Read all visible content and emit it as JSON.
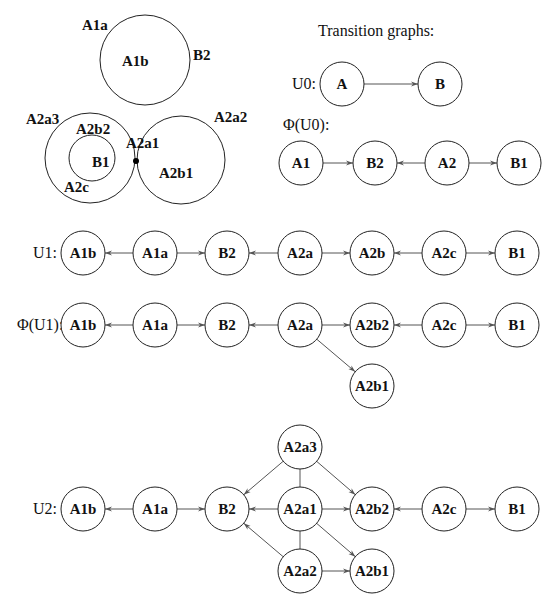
{
  "venn": {
    "circles": [
      {
        "id": "A1",
        "cx": 145,
        "cy": 60,
        "r": 45
      },
      {
        "id": "A2a3_outer",
        "cx": 90,
        "cy": 158,
        "r": 45
      },
      {
        "id": "B1_inner",
        "cx": 92,
        "cy": 158,
        "r": 23
      },
      {
        "id": "A2a2_outer",
        "cx": 181,
        "cy": 160,
        "r": 44
      }
    ],
    "labels": [
      {
        "text": "A1a",
        "x": 82,
        "y": 30
      },
      {
        "text": "A1b",
        "x": 122,
        "y": 66
      },
      {
        "text": "B2",
        "x": 193,
        "y": 60
      },
      {
        "text": "A2a3",
        "x": 26,
        "y": 124
      },
      {
        "text": "A2a2",
        "x": 214,
        "y": 122
      },
      {
        "text": "A2b2",
        "x": 76,
        "y": 134
      },
      {
        "text": "A2a1",
        "x": 126,
        "y": 148
      },
      {
        "text": "B1",
        "x": 92,
        "y": 167
      },
      {
        "text": "A2b1",
        "x": 159,
        "y": 178
      },
      {
        "text": "A2c",
        "x": 64,
        "y": 192
      }
    ],
    "point": {
      "x": 136,
      "y": 161
    }
  },
  "header": {
    "title": "Transition graphs:"
  },
  "graphs": [
    {
      "label": "U0:",
      "label_x": 292,
      "label_y": 89,
      "nodes": [
        {
          "id": "A",
          "x": 342,
          "y": 84
        },
        {
          "id": "B",
          "x": 440,
          "y": 84
        }
      ],
      "edges": [
        {
          "from": "A",
          "to": "B"
        }
      ]
    },
    {
      "label": "Φ(U0):",
      "label_x": 283,
      "label_y": 130,
      "nodes": [
        {
          "id": "A1",
          "x": 301,
          "y": 163
        },
        {
          "id": "B2",
          "x": 375,
          "y": 163
        },
        {
          "id": "A2",
          "x": 447,
          "y": 163
        },
        {
          "id": "B1",
          "x": 519,
          "y": 163
        }
      ],
      "edges": [
        {
          "from": "A1",
          "to": "B2"
        },
        {
          "from": "A2",
          "to": "B2"
        },
        {
          "from": "A2",
          "to": "B1"
        }
      ]
    },
    {
      "label": "U1:",
      "label_x": 33,
      "label_y": 258,
      "nodes": [
        {
          "id": "A1b",
          "x": 83,
          "y": 253
        },
        {
          "id": "A1a",
          "x": 155,
          "y": 253
        },
        {
          "id": "B2",
          "x": 227,
          "y": 253
        },
        {
          "id": "A2a",
          "x": 300,
          "y": 253
        },
        {
          "id": "A2b",
          "x": 372,
          "y": 253
        },
        {
          "id": "A2c",
          "x": 444,
          "y": 253
        },
        {
          "id": "B1",
          "x": 517,
          "y": 253
        }
      ],
      "edges": [
        {
          "from": "A1a",
          "to": "A1b"
        },
        {
          "from": "A1a",
          "to": "B2"
        },
        {
          "from": "A2a",
          "to": "B2"
        },
        {
          "from": "A2a",
          "to": "A2b"
        },
        {
          "from": "A2c",
          "to": "A2b"
        },
        {
          "from": "A2c",
          "to": "B1"
        }
      ]
    },
    {
      "label": "Φ(U1):",
      "label_x": 17,
      "label_y": 330,
      "nodes": [
        {
          "id": "A1b",
          "x": 83,
          "y": 325
        },
        {
          "id": "A1a",
          "x": 155,
          "y": 325
        },
        {
          "id": "B2",
          "x": 227,
          "y": 325
        },
        {
          "id": "A2a",
          "x": 300,
          "y": 325
        },
        {
          "id": "A2b2",
          "x": 372,
          "y": 325
        },
        {
          "id": "A2c",
          "x": 444,
          "y": 325
        },
        {
          "id": "B1",
          "x": 517,
          "y": 325
        },
        {
          "id": "A2b1",
          "x": 372,
          "y": 386
        }
      ],
      "edges": [
        {
          "from": "A1a",
          "to": "A1b"
        },
        {
          "from": "A1a",
          "to": "B2"
        },
        {
          "from": "A2a",
          "to": "B2"
        },
        {
          "from": "A2a",
          "to": "A2b2"
        },
        {
          "from": "A2c",
          "to": "A2b2"
        },
        {
          "from": "A2c",
          "to": "B1"
        },
        {
          "from": "A2a",
          "to": "A2b1"
        }
      ]
    },
    {
      "label": "U2:",
      "label_x": 33,
      "label_y": 514,
      "nodes": [
        {
          "id": "A1b",
          "x": 83,
          "y": 509
        },
        {
          "id": "A1a",
          "x": 155,
          "y": 509
        },
        {
          "id": "B2",
          "x": 227,
          "y": 509
        },
        {
          "id": "A2a3",
          "x": 300,
          "y": 447
        },
        {
          "id": "A2a1",
          "x": 300,
          "y": 509
        },
        {
          "id": "A2a2",
          "x": 300,
          "y": 571
        },
        {
          "id": "A2b2",
          "x": 372,
          "y": 509
        },
        {
          "id": "A2b1",
          "x": 372,
          "y": 571
        },
        {
          "id": "A2c",
          "x": 444,
          "y": 509
        },
        {
          "id": "B1",
          "x": 517,
          "y": 509
        }
      ],
      "edges": [
        {
          "from": "A1a",
          "to": "A1b"
        },
        {
          "from": "A1a",
          "to": "B2"
        },
        {
          "from": "A2a1",
          "to": "B2"
        },
        {
          "from": "A2a3",
          "to": "B2"
        },
        {
          "from": "A2a2",
          "to": "B2"
        },
        {
          "from": "A2a1",
          "to": "A2b2"
        },
        {
          "from": "A2a3",
          "to": "A2b2"
        },
        {
          "from": "A2a1",
          "to": "A2b1"
        },
        {
          "from": "A2a2",
          "to": "A2b1"
        },
        {
          "from": "A2c",
          "to": "A2b2"
        },
        {
          "from": "A2c",
          "to": "B1"
        },
        {
          "from": "A2a3",
          "to": "A2a1",
          "undirected": true
        },
        {
          "from": "A2a1",
          "to": "A2a2",
          "undirected": true
        }
      ]
    }
  ],
  "style": {
    "node_radius": 22,
    "stroke": "#222222",
    "edge": "#555555"
  }
}
